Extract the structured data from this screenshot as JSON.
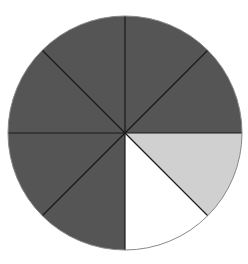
{
  "chart_data": {
    "type": "pie",
    "title": "",
    "slices": 8,
    "categories": [
      "Slice 1",
      "Slice 2",
      "Slice 3",
      "Slice 4",
      "Slice 5",
      "Slice 6",
      "Slice 7",
      "Slice 8"
    ],
    "values": [
      1,
      1,
      1,
      1,
      1,
      1,
      1,
      1
    ],
    "fractions": {
      "dark": "6/8",
      "light": "1/8",
      "white": "1/8"
    },
    "slice_colors": [
      "#555555",
      "#555555",
      "#d0d0d0",
      "#ffffff",
      "#555555",
      "#555555",
      "#555555",
      "#555555"
    ],
    "start_angle_deg": -90,
    "direction": "clockwise",
    "legend": [],
    "grid": false
  },
  "geometry": {
    "cx": 125,
    "cy": 133,
    "r": 117
  },
  "colors": {
    "dark": "#555555",
    "light": "#d0d0d0",
    "white": "#ffffff",
    "divider": "#1a1a1a",
    "outline": "#888888"
  }
}
